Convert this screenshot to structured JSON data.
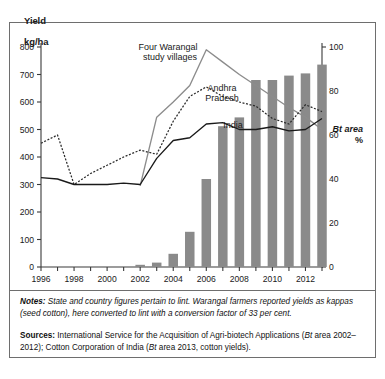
{
  "axes": {
    "y_title": "Yield\nkg/ha",
    "y_title_line1": "Yield",
    "y_title_line2": "kg/ha",
    "right_title_line1": "Bt area",
    "right_title_line2": "%"
  },
  "notes": {
    "label": "Notes:",
    "text": " State and country figures pertain to lint. Warangal farmers reported yields as kappas (seed cotton), here converted to lint with a conversion factor of 33 per cent."
  },
  "sources": {
    "label": "Sources:",
    "text_a": " International Service for the Acquisition of Agri-biotech Applications (",
    "em_a": "Bt",
    "text_b": " area 2002–2012); Cotton Corporation of India (",
    "em_b": "Bt",
    "text_c": " area 2013, cotton yields)."
  },
  "colors": {
    "warangal": "#8c8c8c",
    "andhra": "#2b2b2b",
    "india": "#1a1a1a",
    "bars": "#8a8a8a",
    "axis": "#3a3a3a",
    "frame": "#6e6e6e"
  },
  "chart_data": {
    "type": "line",
    "title": "",
    "xlabel": "",
    "ylabel": "Yield kg/ha",
    "y2label": "Bt area %",
    "xlim": [
      1996,
      2013
    ],
    "ylim": [
      0,
      800
    ],
    "y2lim": [
      0,
      100
    ],
    "yticks": [
      0,
      100,
      200,
      300,
      400,
      500,
      600,
      700,
      800
    ],
    "y2ticks": [
      0,
      20,
      40,
      60,
      80,
      100
    ],
    "xticks": [
      1996,
      1997,
      1998,
      1999,
      2000,
      2001,
      2002,
      2003,
      2004,
      2005,
      2006,
      2007,
      2008,
      2009,
      2010,
      2011,
      2012,
      2013
    ],
    "xticklabels": [
      "1996",
      "",
      "1998",
      "",
      "2000",
      "",
      "2002",
      "",
      "2004",
      "",
      "2006",
      "",
      "2008",
      "",
      "2010",
      "",
      "2012",
      ""
    ],
    "grid": false,
    "legend": "inline-annotations",
    "x": [
      1996,
      1997,
      1998,
      1999,
      2000,
      2001,
      2002,
      2003,
      2004,
      2005,
      2006,
      2007,
      2008,
      2009,
      2010,
      2011,
      2012,
      2013
    ],
    "series": [
      {
        "name": "Four Warangal study villages",
        "style": "solid",
        "color": "#8c8c8c",
        "axis": "left",
        "x": [
          2002,
          2003,
          2004,
          2005,
          2006,
          2007,
          2008,
          2009,
          2010,
          2011,
          2012,
          2013
        ],
        "values": [
          295,
          545,
          600,
          660,
          790,
          745,
          700,
          660,
          620,
          580,
          545,
          500
        ]
      },
      {
        "name": "Andhra Pradesh",
        "style": "dashed",
        "color": "#2b2b2b",
        "axis": "left",
        "x": [
          1996,
          1997,
          1998,
          1999,
          2000,
          2001,
          2002,
          2003,
          2004,
          2005,
          2006,
          2007,
          2008,
          2009,
          2010,
          2011,
          2012,
          2013
        ],
        "values": [
          450,
          480,
          300,
          340,
          370,
          400,
          425,
          410,
          530,
          620,
          655,
          620,
          600,
          585,
          540,
          520,
          590,
          565
        ]
      },
      {
        "name": "India",
        "style": "solid",
        "color": "#1a1a1a",
        "axis": "left",
        "x": [
          1996,
          1997,
          1998,
          1999,
          2000,
          2001,
          2002,
          2003,
          2004,
          2005,
          2006,
          2007,
          2008,
          2009,
          2010,
          2011,
          2012,
          2013
        ],
        "values": [
          325,
          320,
          300,
          300,
          300,
          305,
          300,
          395,
          460,
          470,
          520,
          525,
          500,
          500,
          510,
          495,
          500,
          540
        ]
      },
      {
        "name": "Bt area",
        "style": "bar",
        "color": "#8a8a8a",
        "axis": "right",
        "x": [
          2002,
          2003,
          2004,
          2005,
          2006,
          2007,
          2008,
          2009,
          2010,
          2011,
          2012,
          2013
        ],
        "values": [
          1,
          2,
          6,
          16,
          40,
          64,
          68,
          85,
          85,
          87,
          88,
          92
        ]
      }
    ],
    "annotations": [
      {
        "text": "Four Warangal",
        "x": 168,
        "y": 50
      },
      {
        "text": "study villages",
        "x": 170,
        "y": 60
      },
      {
        "text": "Andhra",
        "x": 222,
        "y": 91
      },
      {
        "text": "Pradesh",
        "x": 222,
        "y": 101
      },
      {
        "text": "India",
        "x": 233,
        "y": 128
      }
    ]
  }
}
